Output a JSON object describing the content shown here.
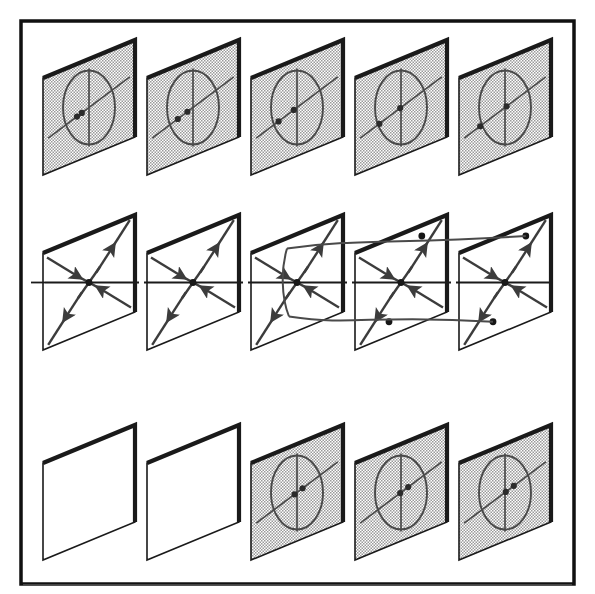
{
  "figure": {
    "title": "",
    "rows": 3,
    "columns": 5,
    "panel_pitch_x": 104,
    "row_tops": [
      40,
      215,
      425
    ],
    "panel_width": 92,
    "panel_height": 135,
    "panel_slant": 38,
    "colors": {
      "ink": "#1a1a1a",
      "frame": "#111111",
      "shade_fill": "#d8d8d8",
      "panel_fill": "#ffffff",
      "curve": "#4a4a4a",
      "arrow": "#3c3c3c"
    }
  },
  "frame": {
    "outer_border_label": "figure-frame",
    "has_bottom_rule": true
  },
  "rows": [
    {
      "name": "top-row",
      "label": "",
      "style": "shaded",
      "panels": [
        {
          "name": "panel-top-1",
          "shaded": true,
          "ellipse": true,
          "dots": 2,
          "dot_offsets": [
            -0.3,
            -0.18
          ]
        },
        {
          "name": "panel-top-2",
          "shaded": true,
          "ellipse": true,
          "dots": 2,
          "dot_offsets": [
            -0.38,
            -0.14
          ]
        },
        {
          "name": "panel-top-3",
          "shaded": true,
          "ellipse": true,
          "dots": 2,
          "dot_offsets": [
            -0.46,
            -0.08
          ]
        },
        {
          "name": "panel-top-4",
          "shaded": true,
          "ellipse": true,
          "dots": 2,
          "dot_offsets": [
            -0.54,
            -0.02
          ]
        },
        {
          "name": "panel-top-5",
          "shaded": true,
          "ellipse": true,
          "dots": 2,
          "dot_offsets": [
            -0.62,
            0.04
          ]
        }
      ]
    },
    {
      "name": "middle-row",
      "label": "",
      "style": "plain",
      "panels": [
        {
          "name": "panel-mid-1",
          "shaded": false,
          "portrait": "saddle",
          "saddle_dots": 1,
          "branch": "none"
        },
        {
          "name": "panel-mid-2",
          "shaded": false,
          "portrait": "saddle",
          "saddle_dots": 1,
          "branch": "none"
        },
        {
          "name": "panel-mid-3",
          "shaded": false,
          "portrait": "saddle-node",
          "saddle_dots": 1,
          "branch": "parabola-vertex"
        },
        {
          "name": "panel-mid-4",
          "shaded": false,
          "portrait": "saddle-split",
          "saddle_dots": 3,
          "branch": "parabola-open"
        },
        {
          "name": "panel-mid-5",
          "shaded": false,
          "portrait": "saddle-split",
          "saddle_dots": 3,
          "branch": "parabola-open"
        }
      ]
    },
    {
      "name": "bottom-row",
      "label": "",
      "style": "mixed",
      "panels": [
        {
          "name": "panel-bot-1",
          "shaded": false,
          "ellipse": false,
          "dots": 0,
          "dot_offsets": []
        },
        {
          "name": "panel-bot-2",
          "shaded": false,
          "ellipse": false,
          "dots": 0,
          "dot_offsets": []
        },
        {
          "name": "panel-bot-3",
          "shaded": true,
          "ellipse": true,
          "dots": 2,
          "dot_offsets": [
            -0.06,
            0.14
          ]
        },
        {
          "name": "panel-bot-4",
          "shaded": true,
          "ellipse": true,
          "dots": 2,
          "dot_offsets": [
            -0.02,
            0.18
          ]
        },
        {
          "name": "panel-bot-5",
          "shaded": true,
          "ellipse": true,
          "dots": 2,
          "dot_offsets": [
            0.02,
            0.22
          ]
        }
      ]
    }
  ],
  "axis": {
    "name": "bifurcation-axis",
    "style": "solid-with-dashed-gaps",
    "y": 298
  }
}
